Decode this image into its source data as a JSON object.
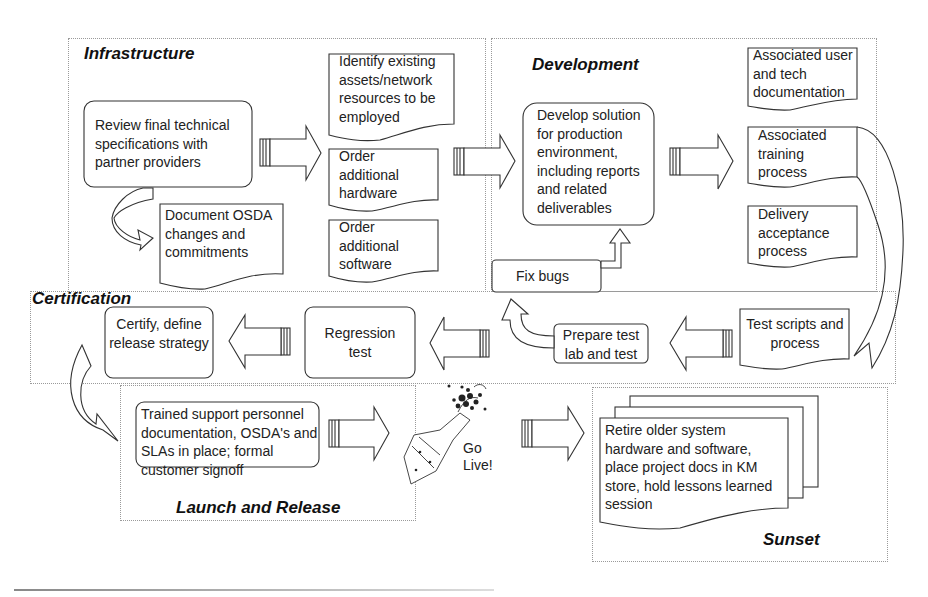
{
  "diagram": {
    "type": "process-flow",
    "phases": [
      {
        "id": "infrastructure",
        "title": "Infrastructure"
      },
      {
        "id": "development",
        "title": "Development"
      },
      {
        "id": "certification",
        "title": "Certification"
      },
      {
        "id": "launch",
        "title": "Launch and Release"
      },
      {
        "id": "sunset",
        "title": "Sunset"
      }
    ],
    "infrastructure": {
      "review": "Review final technical specifications with partner providers",
      "document_osda": "Document OSDA changes and commitments",
      "identify_assets": "Identify existing assets/network resources to be employed",
      "order_hardware": "Order additional hardware",
      "order_software": "Order additional software"
    },
    "development": {
      "develop_solution": "Develop solution for production environment, including reports and related deliverables",
      "fix_bugs": "Fix bugs",
      "user_tech_docs": "Associated user and tech documentation",
      "training": "Associated training process",
      "delivery_acceptance": "Delivery acceptance process"
    },
    "certification": {
      "test_scripts": "Test scripts and process",
      "prepare_test": "Prepare test lab and test",
      "regression": "Regression test",
      "certify": "Certify, define release strategy"
    },
    "launch": {
      "trained_support": "Trained support personnel documentation, OSDA's and SLAs in place; formal customer signoff",
      "go_live": "Go Live!"
    },
    "sunset": {
      "retire": "Retire older system hardware and software, place project docs in KM store, hold lessons learned session"
    },
    "colors": {
      "stroke": "#333333",
      "phase_border": "#9a9a9a",
      "background": "#ffffff"
    }
  }
}
